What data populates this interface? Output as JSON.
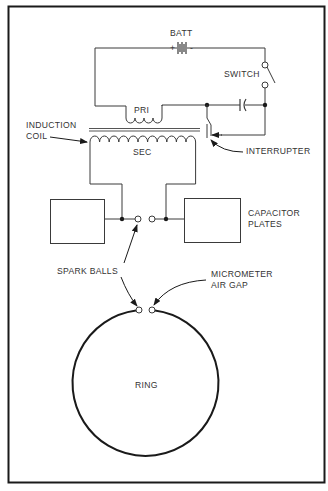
{
  "diagram": {
    "labels": {
      "battery": "BATT",
      "battery_plus": "+",
      "battery_minus": "-",
      "switch": "SWITCH",
      "primary": "PRI",
      "secondary": "SEC",
      "induction_coil_line1": "INDUCTION",
      "induction_coil_line2": "COIL",
      "interrupter": "INTERRUPTER",
      "capacitor_plates_line1": "CAPACITOR",
      "capacitor_plates_line2": "PLATES",
      "spark_balls": "SPARK BALLS",
      "micrometer_line1": "MICROMETER",
      "micrometer_line2": "AIR GAP",
      "ring": "RING"
    },
    "components": [
      "battery",
      "switch",
      "primary-coil",
      "secondary-coil",
      "iron-core",
      "interrupter",
      "capacitor",
      "capacitor-plate-left",
      "capacitor-plate-right",
      "spark-balls",
      "ring",
      "micrometer-air-gap"
    ],
    "colors": {
      "line": "#3a3a3a",
      "frame": "#1a1a1a",
      "text": "#333333",
      "background": "#ffffff"
    }
  }
}
